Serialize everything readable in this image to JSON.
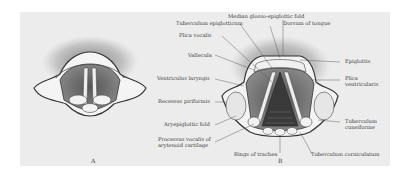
{
  "figure": {
    "captions": {
      "a": "A",
      "b": "B"
    },
    "labels": {
      "median_glosso_epiglottic_fold": "Median glosso-epiglottic fold",
      "tuberculum_epiglotticum": "Tuberculum epiglotticum",
      "dorsum_of_tongue": "Dorsum of tongue",
      "plica_vocalis": "Plica vocalis",
      "vallecula": "Vallecula",
      "ventriculus_laryngis": "Ventriculus laryngis",
      "recessus_piriformis": "Recessus piriformis",
      "aryepiglottic_fold": "Aryepiglottic fold",
      "processus_vocalis_line1": "Processus vocalis of",
      "processus_vocalis_line2": "arytenoid cartilage",
      "rings_of_trachea": "Rings of trachea",
      "tuberculum_corniculatum": "Tuberculum corniculatum",
      "epiglottis": "Epiglottis",
      "plica_ventricularis_line1": "Plica",
      "plica_ventricularis_line2": "ventricularis",
      "tuberculum_cuneiforme_line1": "Tuberculum",
      "tuberculum_cuneiforme_line2": "cuneiforme"
    },
    "colors": {
      "background": "#ffffff",
      "plate": "#ececec",
      "ink": "#3a3a3a"
    }
  }
}
